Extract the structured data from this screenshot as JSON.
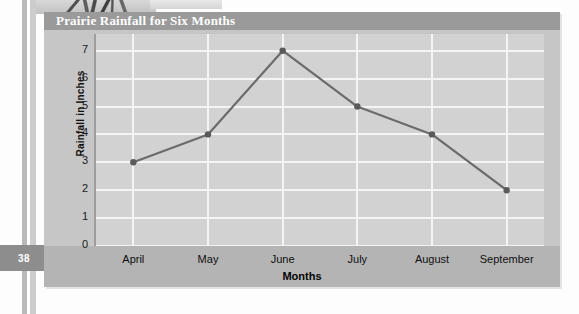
{
  "page": {
    "number": "38"
  },
  "figure": {
    "title": "Prairie Rainfall for Six Months"
  },
  "chart_data": {
    "type": "line",
    "title": "Prairie Rainfall for Six Months",
    "xlabel": "Months",
    "ylabel": "Rainfall in Inches",
    "categories": [
      "April",
      "May",
      "June",
      "July",
      "August",
      "September"
    ],
    "values": [
      3,
      4,
      7,
      5,
      4,
      2
    ],
    "yticks": [
      0,
      1,
      2,
      3,
      4,
      5,
      6,
      7
    ],
    "ylim": [
      0,
      7.6
    ],
    "grid": true,
    "legend": "none",
    "marker": "filled-circle",
    "line_color": "#6b6b6b",
    "marker_color": "#5a5a5a",
    "plot_background": "#d2d2d2",
    "gridline_color": "#f4f4f4",
    "header_color": "#9a9a9a",
    "figure_background": "#c6c6c6"
  }
}
